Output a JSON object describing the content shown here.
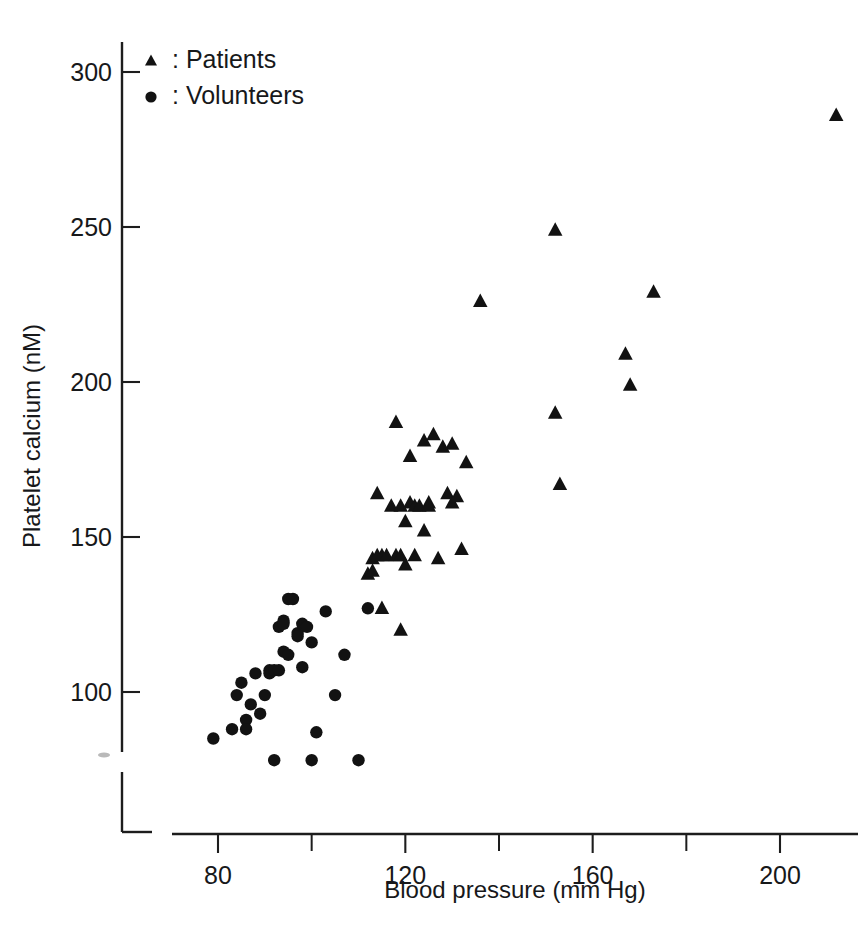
{
  "chart_data": {
    "type": "scatter",
    "title": "",
    "xlabel": "Blood pressure (mm Hg)",
    "ylabel": "Platelet calcium (nM)",
    "xlim": [
      72,
      216
    ],
    "ylim": [
      72,
      312
    ],
    "grid": false,
    "xticks": [
      80,
      120,
      160,
      200
    ],
    "xticks_minor": [
      100,
      140,
      180
    ],
    "yticks": [
      100,
      150,
      200,
      250,
      300
    ],
    "xtick_labels": [
      "80",
      "120",
      "160",
      "200"
    ],
    "ytick_labels": [
      "100",
      "150",
      "200",
      "250",
      "300"
    ],
    "legend_position": "top-left",
    "legend": [
      {
        "marker": "triangle",
        "label": ": Patients"
      },
      {
        "marker": "circle",
        "label": ": Volunteers"
      }
    ],
    "series": [
      {
        "name": "Volunteers",
        "marker": "circle",
        "points": [
          [
            79,
            85
          ],
          [
            83,
            88
          ],
          [
            84,
            99
          ],
          [
            85,
            103
          ],
          [
            86,
            91
          ],
          [
            86,
            88
          ],
          [
            87,
            96
          ],
          [
            88,
            106
          ],
          [
            89,
            93
          ],
          [
            90,
            99
          ],
          [
            91,
            107
          ],
          [
            91,
            106
          ],
          [
            92,
            107
          ],
          [
            92,
            78
          ],
          [
            93,
            121
          ],
          [
            93,
            107
          ],
          [
            94,
            123
          ],
          [
            94,
            122
          ],
          [
            94,
            113
          ],
          [
            95,
            130
          ],
          [
            95,
            112
          ],
          [
            96,
            130
          ],
          [
            97,
            119
          ],
          [
            97,
            118
          ],
          [
            98,
            122
          ],
          [
            98,
            108
          ],
          [
            99,
            121
          ],
          [
            100,
            116
          ],
          [
            100,
            78
          ],
          [
            101,
            87
          ],
          [
            103,
            126
          ],
          [
            105,
            99
          ],
          [
            107,
            112
          ],
          [
            110,
            78
          ],
          [
            112,
            127
          ]
        ]
      },
      {
        "name": "Patients",
        "marker": "triangle",
        "points": [
          [
            112,
            138
          ],
          [
            113,
            139
          ],
          [
            113,
            143
          ],
          [
            114,
            144
          ],
          [
            114,
            164
          ],
          [
            115,
            144
          ],
          [
            115,
            127
          ],
          [
            116,
            144
          ],
          [
            117,
            160
          ],
          [
            118,
            144
          ],
          [
            118,
            187
          ],
          [
            119,
            160
          ],
          [
            119,
            144
          ],
          [
            119,
            120
          ],
          [
            120,
            155
          ],
          [
            120,
            141
          ],
          [
            121,
            161
          ],
          [
            121,
            176
          ],
          [
            122,
            160
          ],
          [
            122,
            144
          ],
          [
            123,
            160
          ],
          [
            124,
            181
          ],
          [
            124,
            152
          ],
          [
            125,
            161
          ],
          [
            125,
            160
          ],
          [
            126,
            183
          ],
          [
            127,
            143
          ],
          [
            128,
            179
          ],
          [
            129,
            164
          ],
          [
            130,
            161
          ],
          [
            130,
            180
          ],
          [
            131,
            163
          ],
          [
            132,
            146
          ],
          [
            133,
            174
          ],
          [
            136,
            226
          ],
          [
            152,
            249
          ],
          [
            152,
            190
          ],
          [
            153,
            167
          ],
          [
            167,
            209
          ],
          [
            168,
            199
          ],
          [
            173,
            229
          ],
          [
            212,
            286
          ]
        ]
      }
    ]
  }
}
